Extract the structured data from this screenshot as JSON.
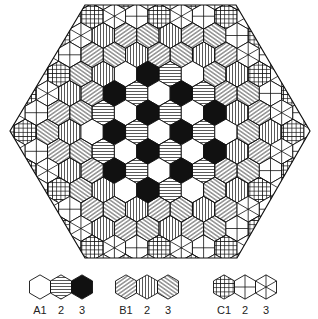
{
  "figure": {
    "colors": {
      "ink": "#111111",
      "paper": "#ffffff"
    },
    "frame": {
      "vertices": [
        [
          85,
          5
        ],
        [
          236,
          5
        ],
        [
          310,
          131
        ],
        [
          237,
          258
        ],
        [
          85,
          258
        ],
        [
          10,
          131
        ]
      ]
    },
    "grid": {
      "center_x": 159,
      "center_y": 132,
      "hex_width": 22.3,
      "row_spacing": 19.3,
      "rows": 13,
      "center_row_count": 13
    },
    "regions": [
      {
        "family": "A",
        "rings": "0-3",
        "cycle": [
          "A1",
          "A3",
          "A2"
        ]
      },
      {
        "family": "B",
        "rings": "4-5",
        "cycle": [
          "B1",
          "B3",
          "B2"
        ]
      },
      {
        "family": "C",
        "rings": "6",
        "cycle": [
          "C1",
          "C3",
          "C2"
        ]
      }
    ],
    "center_row_sequence": [
      "C1",
      "B3",
      "B2",
      "A1",
      "A3",
      "A2",
      "A1",
      "A3",
      "A2",
      "A1",
      "B3",
      "B2",
      "C1"
    ]
  },
  "legend": {
    "groups": [
      {
        "name": "A",
        "items": [
          {
            "id": "A1",
            "label": "A1",
            "fill": "empty-white"
          },
          {
            "id": "A2",
            "label": "2",
            "fill": "horizontal-lines"
          },
          {
            "id": "A3",
            "label": "3",
            "fill": "solid-black"
          }
        ]
      },
      {
        "name": "B",
        "items": [
          {
            "id": "B1",
            "label": "B1",
            "fill": "diagonal-lines-up"
          },
          {
            "id": "B2",
            "label": "2",
            "fill": "vertical-lines"
          },
          {
            "id": "B3",
            "label": "3",
            "fill": "diagonal-lines-down"
          }
        ]
      },
      {
        "name": "C",
        "items": [
          {
            "id": "C1",
            "label": "C1",
            "fill": "grid-crosshatch"
          },
          {
            "id": "C2",
            "label": "2",
            "fill": "cross-through-vertices"
          },
          {
            "id": "C3",
            "label": "3",
            "fill": "star-triangles"
          }
        ]
      }
    ]
  }
}
